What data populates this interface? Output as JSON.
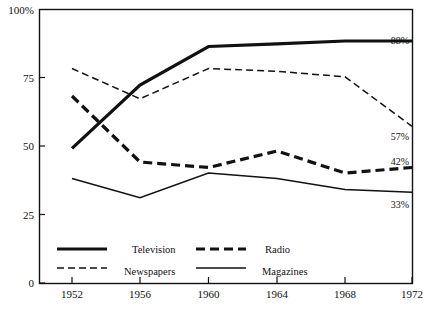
{
  "chart_data": {
    "type": "line",
    "title": "",
    "xlabel": "",
    "ylabel": "",
    "x": [
      1952,
      1956,
      1960,
      1964,
      1968,
      1972
    ],
    "categories": [
      "1952",
      "1956",
      "1960",
      "1964",
      "1968",
      "1972"
    ],
    "ylim": [
      0,
      100
    ],
    "xlim": [
      1950,
      1973
    ],
    "ytick_labels": [
      "0",
      "25",
      "50",
      "75",
      "100%"
    ],
    "ytick_values": [
      0,
      25,
      50,
      75,
      100
    ],
    "grid": false,
    "legend_position": "inside-bottom-left",
    "series": [
      {
        "name": "Television",
        "style": "thick-solid",
        "values": [
          49,
          72,
          86,
          87,
          88,
          88
        ],
        "end_label": "88%"
      },
      {
        "name": "Radio",
        "style": "thick-dashed",
        "values": [
          68,
          44,
          42,
          48,
          40,
          42
        ],
        "end_label": "42%"
      },
      {
        "name": "Newspapers",
        "style": "thin-dashed",
        "values": [
          78,
          67,
          78,
          77,
          75,
          57
        ],
        "end_label": "57%"
      },
      {
        "name": "Magazines",
        "style": "thin-solid",
        "values": [
          38,
          31,
          40,
          38,
          34,
          33
        ],
        "end_label": "33%"
      }
    ],
    "end_labels": [
      "88%",
      "57%",
      "42%",
      "33%"
    ],
    "colors": {
      "line": "#111111",
      "axis": "#111111",
      "background": "#ffffff"
    }
  },
  "axis": {
    "y_top_label": "100%",
    "y_labels": {
      "t0": "0",
      "t25": "25",
      "t50": "50",
      "t75": "75",
      "t100": "100%"
    },
    "x_labels": {
      "x1952": "1952",
      "x1956": "1956",
      "x1960": "1960",
      "x1964": "1964",
      "x1968": "1968",
      "x1972": "1972"
    }
  },
  "legend": {
    "items": [
      {
        "label": "Television"
      },
      {
        "label": "Radio"
      },
      {
        "label": "Newspapers"
      },
      {
        "label": "Magazines"
      }
    ]
  },
  "annotations": {
    "television_end": "88%",
    "newspapers_end": "57%",
    "radio_end": "42%",
    "magazines_end": "33%"
  }
}
